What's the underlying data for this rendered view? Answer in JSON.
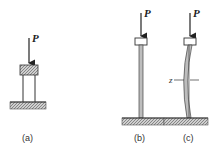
{
  "figure": {
    "load_label": "P",
    "deflection_label": "z",
    "captions": [
      "(a)",
      "(b)",
      "(c)"
    ],
    "panels": [
      {
        "id": "a",
        "description": "short column with load block under axial load"
      },
      {
        "id": "b",
        "description": "long slender column under axial load"
      },
      {
        "id": "c",
        "description": "buckled column with lateral deflection"
      }
    ]
  }
}
